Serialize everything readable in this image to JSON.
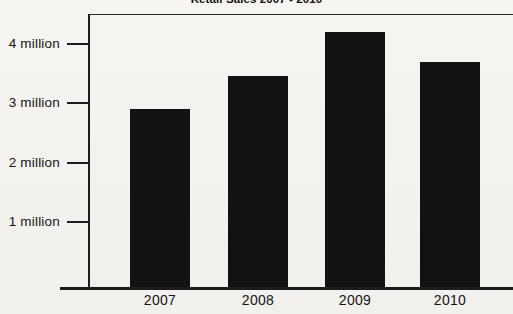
{
  "chart_data": {
    "type": "bar",
    "title": "Retail Sales 2007 - 2010",
    "xlabel": "",
    "ylabel": "",
    "categories": [
      "2007",
      "2008",
      "2009",
      "2010"
    ],
    "values": [
      3.0,
      3.55,
      4.28,
      3.78
    ],
    "value_unit": "million",
    "ylim": [
      0,
      4.64
    ],
    "ytick_values": [
      1,
      2,
      3,
      4
    ],
    "ytick_labels": [
      "1 million",
      "2 million",
      "3 million",
      "4 million"
    ],
    "grid": false,
    "legend": null,
    "bar_color": "#141210",
    "axis_color": "#1c1c1c",
    "background_color": "#f3f2ef"
  }
}
